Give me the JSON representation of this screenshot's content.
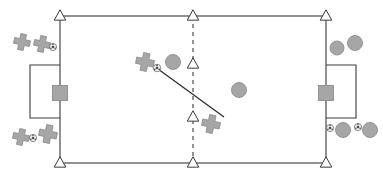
{
  "diagram": {
    "type": "soccer-field-tactical-diagram",
    "title": "",
    "canvas": {
      "width": 383,
      "height": 179
    },
    "colors": {
      "line": "#3a3a3a",
      "field_fill": "#ffffff",
      "marker_gray": "#a6a6a6",
      "marker_gray_stroke": "#8c8c8c",
      "ball_white": "#f2f2f2",
      "ball_spot": "#4d4d4d",
      "triangle_fill": "#ffffff",
      "background": "#ffffff"
    },
    "field": {
      "name": "pitch-outline",
      "x": 60,
      "y": 16,
      "width": 266,
      "height": 147,
      "stroke_width": 1.1
    },
    "center_line": {
      "name": "center-dashed-line",
      "x": 193,
      "y1": 16,
      "y2": 163,
      "dash": "4,4",
      "stroke_width": 1.1
    },
    "pass_line": {
      "name": "pass-trajectory-line",
      "x1": 158,
      "y1": 69,
      "x2": 224,
      "y2": 117,
      "stroke_width": 1.2
    },
    "goal_boxes": [
      {
        "name": "goal-box-left",
        "side": "left",
        "x": 30,
        "y": 65,
        "width": 30,
        "height": 53
      },
      {
        "name": "goal-box-right",
        "side": "right",
        "x": 326,
        "y": 65,
        "width": 30,
        "height": 53
      }
    ],
    "goalkeepers": [
      {
        "name": "goalkeeper-left",
        "side": "left",
        "cx": 60,
        "cy": 93,
        "size": 15
      },
      {
        "name": "goalkeeper-right",
        "side": "right",
        "cx": 326,
        "cy": 93,
        "size": 15
      }
    ],
    "cones": [
      {
        "name": "cone-top-left",
        "cx": 60,
        "cy": 16,
        "size": 8
      },
      {
        "name": "cone-top-center",
        "cx": 193,
        "cy": 16,
        "size": 8
      },
      {
        "name": "cone-top-right",
        "cx": 326,
        "cy": 16,
        "size": 8
      },
      {
        "name": "cone-mid-upper",
        "cx": 193,
        "cy": 64,
        "size": 8
      },
      {
        "name": "cone-mid-lower",
        "cx": 193,
        "cy": 117,
        "size": 8
      },
      {
        "name": "cone-bottom-left",
        "cx": 60,
        "cy": 163,
        "size": 8
      },
      {
        "name": "cone-bottom-center",
        "cx": 193,
        "cy": 163,
        "size": 8
      },
      {
        "name": "cone-bottom-right",
        "cx": 326,
        "cy": 163,
        "size": 8
      }
    ],
    "crosses": [
      {
        "name": "player-cross-outside-top-left-1",
        "cx": 22,
        "cy": 42,
        "size": 8.5
      },
      {
        "name": "player-cross-outside-top-left-2",
        "cx": 42,
        "cy": 44,
        "size": 8.5
      },
      {
        "name": "player-cross-outside-bot-left-1",
        "cx": 21,
        "cy": 137,
        "size": 8.5
      },
      {
        "name": "player-cross-outside-bot-left-2",
        "cx": 48,
        "cy": 134,
        "size": 9.5
      },
      {
        "name": "player-cross-midfield-ball-carrier",
        "cx": 145,
        "cy": 62,
        "size": 9.5
      },
      {
        "name": "player-cross-midfield-receiver",
        "cx": 211,
        "cy": 124,
        "size": 9.5
      }
    ],
    "circles": [
      {
        "name": "player-circle-midfield-upper",
        "cx": 173,
        "cy": 62,
        "r": 7.5
      },
      {
        "name": "player-circle-midfield-lower",
        "cx": 239,
        "cy": 90,
        "r": 7.5
      },
      {
        "name": "player-circle-outside-top-right-1",
        "cx": 337,
        "cy": 48,
        "r": 7
      },
      {
        "name": "player-circle-outside-top-right-2",
        "cx": 355,
        "cy": 43,
        "r": 7.5
      },
      {
        "name": "player-circle-outside-bot-right-1",
        "cx": 343,
        "cy": 130,
        "r": 7.5
      },
      {
        "name": "player-circle-outside-bot-right-2",
        "cx": 370,
        "cy": 130,
        "r": 7.5
      }
    ],
    "balls": [
      {
        "name": "ball-outside-top-left",
        "cx": 53,
        "cy": 47,
        "r": 3.6
      },
      {
        "name": "ball-outside-bot-left",
        "cx": 33,
        "cy": 138,
        "r": 3.6
      },
      {
        "name": "ball-midfield-in-play",
        "cx": 157,
        "cy": 68,
        "r": 3.8
      },
      {
        "name": "ball-outside-bot-right-1",
        "cx": 330,
        "cy": 128,
        "r": 3.6
      },
      {
        "name": "ball-outside-bot-right-2",
        "cx": 358,
        "cy": 127,
        "r": 3.6
      }
    ],
    "legend": {
      "cross_label": "Attacking player",
      "circle_label": "Defending player",
      "ball_label": "Ball",
      "cone_label": "Cone marker",
      "keeper_label": "Goalkeeper",
      "dashed_label": "Halfway line",
      "pass_label": "Pass direction"
    }
  }
}
